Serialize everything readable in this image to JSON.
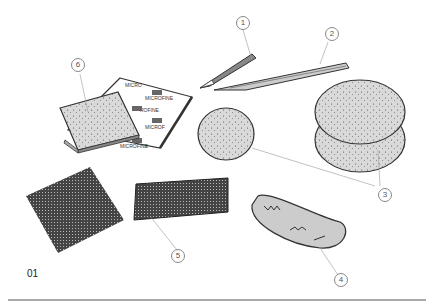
{
  "figure": {
    "number": "01",
    "callouts": [
      {
        "id": "1",
        "label": "1",
        "item": "hobby knife"
      },
      {
        "id": "2",
        "label": "2",
        "item": "scraper blade"
      },
      {
        "id": "3",
        "label": "3",
        "item": "sponges"
      },
      {
        "id": "4",
        "label": "4",
        "item": "cloth/chamois"
      },
      {
        "id": "5",
        "label": "5",
        "item": "mesh pad"
      },
      {
        "id": "6",
        "label": "6",
        "item": "sanding sponge"
      }
    ],
    "pad_text": [
      "3M",
      "MICROFINE"
    ]
  }
}
